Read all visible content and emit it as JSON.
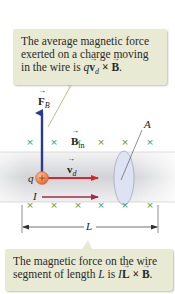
{
  "callouts": {
    "top": {
      "line1": "The average magnetic force",
      "line2": "exerted on a charge moving",
      "line3_prefix": "in the wire is ",
      "formula_q": "q",
      "formula_v": "v",
      "formula_sub": "d",
      "formula_times": " × ",
      "formula_B": "B",
      "formula_end": "."
    },
    "bottom": {
      "line1": "The magnetic force on the wire",
      "line2_prefix": "segment of length ",
      "L_italic": "L",
      "is": " is ",
      "formula_I": "I",
      "formula_L": "L",
      "formula_times": " × ",
      "formula_B": "B",
      "formula_end": "."
    }
  },
  "labels": {
    "force": "F",
    "force_sub": "B",
    "field": "B",
    "field_sub": "in",
    "velocity": "v",
    "velocity_sub": "d",
    "charge": "q",
    "current": "I",
    "area": "A",
    "length": "L"
  },
  "field_marker": "×",
  "colors": {
    "callout_bg": "#e9ead4",
    "force_arrow": "#2b3a8c",
    "velocity_arrow": "#d8262b",
    "current_arrow": "#9c2d4a",
    "charge": "#e8703a",
    "field_marks": "#3f9a4f",
    "wire": "#d9dadc",
    "cross_section": "#dde3f2"
  }
}
